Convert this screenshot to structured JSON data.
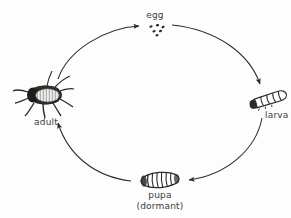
{
  "diagram": {
    "background_color": "#fdfdfd",
    "ink_color": "#2b2b2b",
    "text_color": "#3a3a3a",
    "stages": [
      {
        "id": "egg",
        "label": "egg",
        "illustration": "egg-cluster-illustration",
        "position": "top"
      },
      {
        "id": "larva",
        "label": "larva",
        "illustration": "larva-grub-illustration",
        "position": "right"
      },
      {
        "id": "pupa",
        "label": "pupa",
        "sublabel": "(dormant)",
        "illustration": "pupa-cocoon-illustration",
        "position": "bottom"
      },
      {
        "id": "adult",
        "label": "adult",
        "illustration": "adult-beetle-illustration",
        "position": "left"
      }
    ],
    "arrows": [
      {
        "id": "adult-to-egg",
        "from": "adult",
        "to": "egg"
      },
      {
        "id": "egg-to-larva",
        "from": "egg",
        "to": "larva"
      },
      {
        "id": "larva-to-pupa",
        "from": "larva",
        "to": "pupa"
      },
      {
        "id": "pupa-to-adult",
        "from": "pupa",
        "to": "adult"
      }
    ]
  }
}
